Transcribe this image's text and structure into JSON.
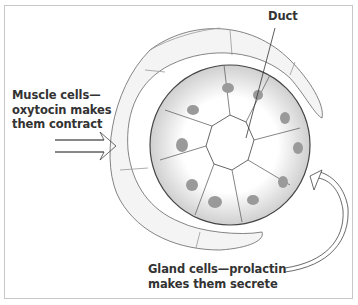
{
  "figure": {
    "type": "illustration",
    "labels": {
      "duct": "Duct",
      "muscle": [
        "Muscle cells—",
        "oxytocin makes",
        "them contract"
      ],
      "gland": [
        "Gland cells—prolactin",
        "makes them secrete"
      ]
    },
    "icons": {
      "muscle_arrows": "double-right-arrow-icon",
      "gland_arrow": "curved-arrow-icon"
    },
    "colors": {
      "text": "#333333",
      "line": "#555555",
      "nucleus": "#9a9a9a",
      "border": "#c8c8c8"
    }
  }
}
